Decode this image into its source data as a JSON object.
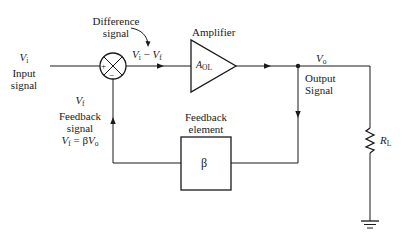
{
  "diagram": {
    "input": {
      "symbol": "V",
      "subscript": "i",
      "line1": "Input",
      "line2": "signal"
    },
    "difference": {
      "line1": "Difference",
      "line2": "signal",
      "expr_a": "V",
      "expr_a_sub": "i",
      "expr_op": " − ",
      "expr_b": "V",
      "expr_b_sub": "f"
    },
    "summing_junction": {
      "plus": "+",
      "minus": "−"
    },
    "amplifier": {
      "label": "Amplifier",
      "gain_symbol": "A",
      "gain_sub": "OL"
    },
    "output": {
      "symbol": "V",
      "subscript": "o",
      "line1": "Output",
      "line2": "Signal"
    },
    "feedback_element": {
      "line1": "Feedback",
      "line2": "element",
      "symbol": "β"
    },
    "feedback_signal": {
      "symbol": "V",
      "subscript": "f",
      "line1": "Feedback",
      "line2": "signal",
      "eq_lhs": "V",
      "eq_lhs_sub": "f",
      "eq_mid": " = β",
      "eq_rhs": "V",
      "eq_rhs_sub": "o"
    },
    "load": {
      "symbol": "R",
      "subscript": "L"
    },
    "colors": {
      "line": "#1a1a1a",
      "background": "#ffffff"
    }
  }
}
